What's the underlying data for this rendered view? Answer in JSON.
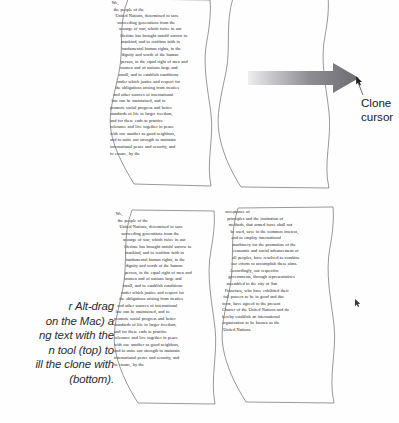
{
  "figure": {
    "background_color": "#fefefe",
    "outline_color": "#6d6d72",
    "text_color": "#18181a",
    "arrow_color": "#6f6f74",
    "caption_color": "#2b2b2e"
  },
  "annotations": {
    "clone_cursor_label_line1": "Clone",
    "clone_cursor_label_line2": "cursor",
    "arrow_name": "gray-gradient-arrow",
    "cursor_glyph": "↖"
  },
  "caption": {
    "lines": [
      "r Alt-drag",
      "on the Mac) a",
      "ng text with the",
      "n tool (top) to",
      "ill the clone with",
      "(bottom)."
    ],
    "full_text": "r Alt-drag (on the Mac) a ng text with the n tool (top) to ill the clone with (bottom)."
  },
  "panels": {
    "source_top": {
      "label": "source-text-block-top",
      "lines": [
        "We,",
        "the people of the",
        "United Nations, determined to save",
        "succeeding generations from the",
        "scourge of war, which twice in our",
        "lifetime has brought untold sorrow to",
        "mankind, and to reaffirm faith in",
        "fundamental human rights, in the",
        "dignity and worth of the human",
        "person, in the equal right of men and",
        "women and of nations large and",
        "small, and to establish conditions",
        "under which justice and respect for",
        "the obligations arising from treaties",
        "and other sources of international",
        "law can be maintained, and to",
        "promote social progress and better",
        "standards of life in larger freedom,",
        "and for these ends to practice",
        "tolerance and live together in peace",
        "with one another as good neighbors,",
        "and to unite our strength to maintain",
        "international peace and security, and",
        "to ensure, by the"
      ]
    },
    "destination_top": {
      "label": "empty-destination-block-top",
      "lines": []
    },
    "source_bottom": {
      "label": "source-text-block-bottom",
      "lines": [
        "We,",
        "the people of the",
        "United Nations, determined to save",
        "succeeding generations from the",
        "scourge of war, which twice in our",
        "lifetime has brought untold sorrow to",
        "mankind, and to reaffirm faith in",
        "fundamental human rights, in the",
        "dignity and worth of the human",
        "person, in the equal right of men and",
        "women and of nations large and",
        "small, and to establish conditions",
        "under which justice and respect for",
        "the obligations arising from treaties",
        "and other sources of international",
        "law can be maintained, and to",
        "promote social progress and better",
        "standards of life in larger freedom,",
        "and for these ends to practice",
        "tolerance and live together in peace",
        "with one another as good neighbors,",
        "and to unite our strength to maintain",
        "international peace and security, and",
        "to ensure, by the"
      ]
    },
    "cloned_bottom": {
      "label": "cloned-text-block-bottom",
      "lines": [
        "acceptance of",
        "principles and the institution of",
        "methods, that armed force shall not",
        "be used, save in the common interest,",
        "and to employ international",
        "machinery for the promotion of the",
        "economic and social advancement of",
        "all peoples, have resolved to combine",
        "our efforts to accomplish these aims.",
        "Accordingly, our respective",
        "governments, through representatives",
        "assembled in the city of San",
        "Francisco, who have exhibited their",
        "full powers to be in good and due",
        "form, have agreed to the present",
        "Charter of the United Nations and do",
        "hereby establish an international",
        "organization to be known as the",
        "United Nations."
      ]
    }
  }
}
